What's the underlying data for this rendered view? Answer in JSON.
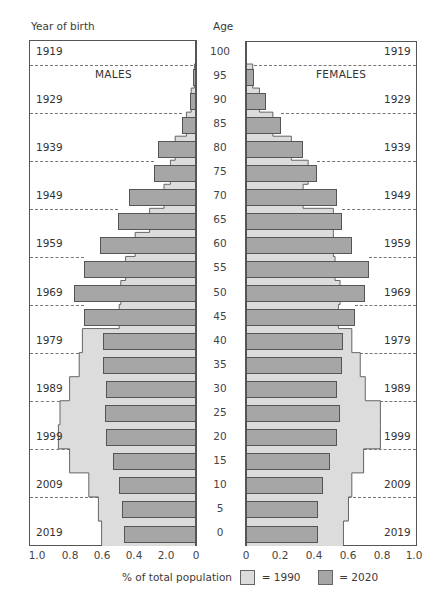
{
  "chart_data": {
    "type": "bar",
    "subtype": "population-pyramid",
    "title": "",
    "left_header": "Year of birth",
    "center_header": "Age",
    "panels": [
      "MALES",
      "FEMALES"
    ],
    "xlabel": "% of total population",
    "x_ticks_left": [
      "1.0",
      "0.8",
      "0.6",
      "0.4",
      "2.0",
      "0"
    ],
    "x_ticks_right": [
      "0",
      "0.2",
      "0.4",
      "0.6",
      "0.8",
      "1.0"
    ],
    "xlim": [
      0,
      1.0
    ],
    "age_ticks": [
      "100",
      "95",
      "90",
      "85",
      "80",
      "75",
      "70",
      "65",
      "60",
      "55",
      "50",
      "45",
      "40",
      "35",
      "30",
      "25",
      "20",
      "15",
      "10",
      "5",
      "0"
    ],
    "year_of_birth_ticks": [
      "1919",
      "1929",
      "1939",
      "1949",
      "1959",
      "1969",
      "1979",
      "1989",
      "1999",
      "2009",
      "2019"
    ],
    "categories": [
      "95",
      "90",
      "85",
      "80",
      "75",
      "70",
      "65",
      "60",
      "55",
      "50",
      "45",
      "40",
      "35",
      "30",
      "25",
      "20",
      "15",
      "10",
      "5",
      "0"
    ],
    "series": [
      {
        "name": "Males 1990",
        "sex": "male",
        "year": "1990",
        "values": [
          0.01,
          0.03,
          0.06,
          0.13,
          0.16,
          0.2,
          0.29,
          0.38,
          0.44,
          0.47,
          0.48,
          0.71,
          0.73,
          0.79,
          0.85,
          0.86,
          0.79,
          0.67,
          0.61,
          0.59
        ]
      },
      {
        "name": "Males 2020",
        "sex": "male",
        "year": "2020",
        "values": [
          0.02,
          0.04,
          0.09,
          0.24,
          0.26,
          0.42,
          0.49,
          0.6,
          0.7,
          0.76,
          0.7,
          0.58,
          0.58,
          0.56,
          0.57,
          0.56,
          0.52,
          0.48,
          0.46,
          0.45
        ]
      },
      {
        "name": "Females 1990",
        "sex": "female",
        "year": "1990",
        "values": [
          0.04,
          0.08,
          0.16,
          0.27,
          0.37,
          0.34,
          0.52,
          0.52,
          0.53,
          0.56,
          0.55,
          0.63,
          0.68,
          0.71,
          0.8,
          0.8,
          0.7,
          0.63,
          0.61,
          0.58
        ]
      },
      {
        "name": "Females 2020",
        "sex": "female",
        "year": "2020",
        "values": [
          0.05,
          0.12,
          0.21,
          0.34,
          0.42,
          0.54,
          0.57,
          0.63,
          0.73,
          0.71,
          0.65,
          0.58,
          0.57,
          0.54,
          0.56,
          0.54,
          0.5,
          0.46,
          0.43,
          0.43
        ]
      }
    ],
    "legend": [
      {
        "label": "= 1990",
        "color": "#dcdcdc"
      },
      {
        "label": "= 2020",
        "color": "#a6a6a6"
      }
    ],
    "grid": "dashed lines every 10 years of age",
    "legend_position": "bottom"
  },
  "header": {
    "year_of_birth": "Year of birth",
    "age": "Age"
  },
  "panels": {
    "males": "MALES",
    "females": "FEMALES"
  },
  "legend": {
    "title": "% of total population",
    "item1990": "= 1990",
    "item2020": "= 2020"
  },
  "colors": {
    "c1990": "#dcdcdc",
    "c2020": "#a6a6a6",
    "border": "#555555"
  }
}
